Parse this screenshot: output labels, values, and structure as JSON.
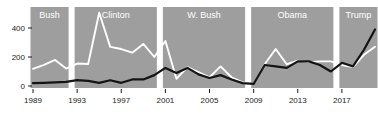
{
  "chart_data": {
    "type": "line",
    "title": "",
    "subtitle": "",
    "xlabel": "",
    "ylabel": "",
    "xlim": [
      1989,
      2020
    ],
    "ylim": [
      0,
      520
    ],
    "grid": false,
    "legend_position": "none",
    "x": [
      1989,
      1990,
      1991,
      1992,
      1993,
      1994,
      1995,
      1996,
      1997,
      1998,
      1999,
      2000,
      2001,
      2002,
      2003,
      2004,
      2005,
      2006,
      2007,
      2008,
      2009,
      2010,
      2011,
      2012,
      2013,
      2014,
      2015,
      2016,
      2017,
      2018,
      2019,
      2020
    ],
    "xticks": [
      1989,
      1993,
      1997,
      2001,
      2005,
      2009,
      2013,
      2017
    ],
    "xtick_labels": [
      "1989",
      "1993",
      "1997",
      "2001",
      "2005",
      "2009",
      "2013",
      "2017"
    ],
    "yticks": [
      0,
      200,
      400
    ],
    "ytick_labels": [
      "0",
      "200",
      "400"
    ],
    "series": [
      {
        "name": "white-series",
        "color": "#ffffff",
        "values": [
          118,
          145,
          180,
          120,
          155,
          152,
          505,
          270,
          255,
          230,
          290,
          200,
          310,
          50,
          130,
          95,
          60,
          135,
          60,
          25,
          15,
          150,
          255,
          150,
          175,
          165,
          170,
          170,
          145,
          130,
          215,
          270
        ]
      },
      {
        "name": "black-series",
        "color": "#141414",
        "values": [
          20,
          22,
          25,
          28,
          40,
          35,
          22,
          40,
          22,
          45,
          45,
          75,
          125,
          90,
          125,
          80,
          55,
          75,
          45,
          20,
          15,
          145,
          135,
          125,
          170,
          170,
          145,
          100,
          160,
          135,
          250,
          390
        ]
      }
    ],
    "eras": [
      {
        "label": "Bush",
        "start": 1989,
        "end": 1992
      },
      {
        "label": "Clinton",
        "start": 1993,
        "end": 2000
      },
      {
        "label": "W. Bush",
        "start": 2001,
        "end": 2008
      },
      {
        "label": "Obama",
        "start": 2009,
        "end": 2016
      },
      {
        "label": "Trump",
        "start": 2017,
        "end": 2020
      }
    ],
    "colors": {
      "band": "#9e9e9e",
      "white_series": "#ffffff",
      "black_series": "#141414",
      "axis_text": "#1a1a1a",
      "background": "#ffffff"
    }
  }
}
